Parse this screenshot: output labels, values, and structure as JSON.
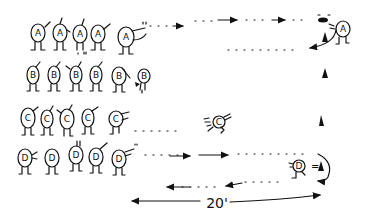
{
  "diagram": {
    "type": "relay drill illustration",
    "style": "hand-drawn ink sketch",
    "colors": {
      "ink": "#111111",
      "background": "#ffffff"
    },
    "rows": [
      {
        "team": "A",
        "player_count": 5,
        "y": 38,
        "moving_player": {
          "label": "A",
          "position": "far right, turning around cone"
        }
      },
      {
        "team": "B",
        "player_count": 5,
        "y": 80,
        "moving_player": {
          "label": "B",
          "position": "tagging back of line"
        }
      },
      {
        "team": "C",
        "player_count": 5,
        "y": 122,
        "moving_player": {
          "label": "C",
          "position": "running right mid-course"
        }
      },
      {
        "team": "D",
        "player_count": 5,
        "y": 160,
        "moving_player": {
          "label": "D",
          "position": "at cone",
          "note": "D = ▲"
        }
      }
    ],
    "cones": [
      {
        "name": "cone-1",
        "x": 328,
        "y": 36
      },
      {
        "name": "cone-2",
        "x": 325,
        "y": 73
      },
      {
        "name": "cone-3",
        "x": 320,
        "y": 120
      },
      {
        "name": "cone-4",
        "x": 321,
        "y": 165
      }
    ],
    "annotations": {
      "distance_label": "20'",
      "equation_label": "=",
      "marker_symbol": "▲"
    }
  }
}
